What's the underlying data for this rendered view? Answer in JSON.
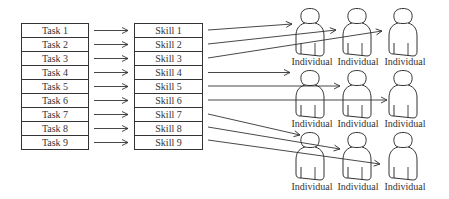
{
  "diagram": {
    "tasks": [
      {
        "label": "Task 1"
      },
      {
        "label": "Task 2"
      },
      {
        "label": "Task 3"
      },
      {
        "label": "Task 4"
      },
      {
        "label": "Task 5"
      },
      {
        "label": "Task 6"
      },
      {
        "label": "Task 7"
      },
      {
        "label": "Task 8"
      },
      {
        "label": "Task 9"
      }
    ],
    "skills": [
      {
        "label": "Skill 1"
      },
      {
        "label": "Skill 2"
      },
      {
        "label": "Skill 3"
      },
      {
        "label": "Skill 4"
      },
      {
        "label": "Skill 5"
      },
      {
        "label": "Skill 6"
      },
      {
        "label": "Skill 7"
      },
      {
        "label": "Skill 8"
      },
      {
        "label": "Skill 9"
      }
    ],
    "individuals": [
      {
        "label": "Individual"
      },
      {
        "label": "Individual"
      },
      {
        "label": "Individual"
      },
      {
        "label": "Individual"
      },
      {
        "label": "Individual"
      },
      {
        "label": "Individual"
      },
      {
        "label": "Individual"
      },
      {
        "label": "Individual"
      },
      {
        "label": "Individual"
      }
    ],
    "mappings": [
      {
        "from": "Task 1",
        "to": "Skill 1"
      },
      {
        "from": "Task 2",
        "to": "Skill 2"
      },
      {
        "from": "Task 3",
        "to": "Skill 3"
      },
      {
        "from": "Task 4",
        "to": "Skill 4"
      },
      {
        "from": "Task 5",
        "to": "Skill 5"
      },
      {
        "from": "Task 6",
        "to": "Skill 6"
      },
      {
        "from": "Task 7",
        "to": "Skill 7"
      },
      {
        "from": "Task 8",
        "to": "Skill 8"
      },
      {
        "from": "Task 9",
        "to": "Skill 9"
      },
      {
        "from": "Skill 1",
        "to": "Individual 1"
      },
      {
        "from": "Skill 2",
        "to": "Individual 2"
      },
      {
        "from": "Skill 3",
        "to": "Individual 3"
      },
      {
        "from": "Skill 4",
        "to": "Individual 4"
      },
      {
        "from": "Skill 5",
        "to": "Individual 5"
      },
      {
        "from": "Skill 6",
        "to": "Individual 6"
      },
      {
        "from": "Skill 7",
        "to": "Individual 7"
      },
      {
        "from": "Skill 8",
        "to": "Individual 8"
      },
      {
        "from": "Skill 9",
        "to": "Individual 9"
      }
    ]
  }
}
